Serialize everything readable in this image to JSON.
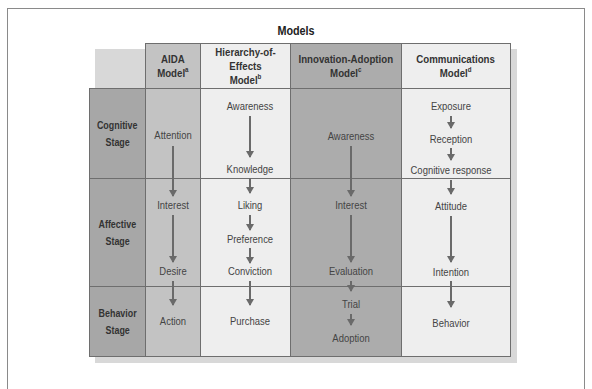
{
  "title": "Models",
  "stages_header": "Stages",
  "models": [
    {
      "name": "AIDA",
      "line2": "Model",
      "note": "a"
    },
    {
      "name": "Hierarchy-of-Effects",
      "line2": "Model",
      "note": "b"
    },
    {
      "name": "Innovation-Adoption",
      "line2": "Model",
      "note": "c"
    },
    {
      "name": "Communications",
      "line2": "Model",
      "note": "d"
    }
  ],
  "stages": [
    {
      "line1": "Cognitive",
      "line2": "Stage"
    },
    {
      "line1": "Affective",
      "line2": "Stage"
    },
    {
      "line1": "Behavior",
      "line2": "Stage"
    }
  ],
  "steps": {
    "aida": [
      "Attention",
      "Interest",
      "Desire",
      "Action"
    ],
    "hierarchy_of_effects": [
      "Awareness",
      "Knowledge",
      "Liking",
      "Preference",
      "Conviction",
      "Purchase"
    ],
    "innovation_adoption": [
      "Awareness",
      "Interest",
      "Evaluation",
      "Trial",
      "Adoption"
    ],
    "communications": [
      "Exposure",
      "Reception",
      "Cognitive response",
      "Attitude",
      "Intention",
      "Behavior"
    ]
  },
  "colors": {
    "stage_column": "#a7a7a7",
    "aida_column": "#c3c3c3",
    "hierarchy_column": "#eeeeee",
    "innovation_column": "#acacac",
    "communications_column": "#eeeeee",
    "arrow": "#6a6a6a"
  }
}
